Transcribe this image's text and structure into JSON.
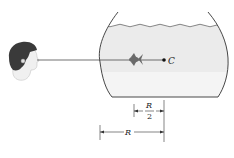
{
  "diagram": {
    "type": "physics-optics",
    "labels": {
      "center": "C",
      "half_radius_num": "R",
      "half_radius_den": "2",
      "radius": "R"
    },
    "colors": {
      "water": "#ebebeb",
      "water_lower": "#f4f4f4",
      "line": "#333333",
      "hair": "#3a3a3a",
      "skin": "#efefef",
      "fish": "#6a6a6a"
    },
    "elements": [
      {
        "name": "observer-head"
      },
      {
        "name": "sight-line"
      },
      {
        "name": "fish-bowl"
      },
      {
        "name": "water"
      },
      {
        "name": "fish"
      },
      {
        "name": "center-point",
        "label": "C"
      },
      {
        "name": "dimension-half-radius",
        "label": "R/2"
      },
      {
        "name": "dimension-radius",
        "label": "R"
      }
    ]
  }
}
